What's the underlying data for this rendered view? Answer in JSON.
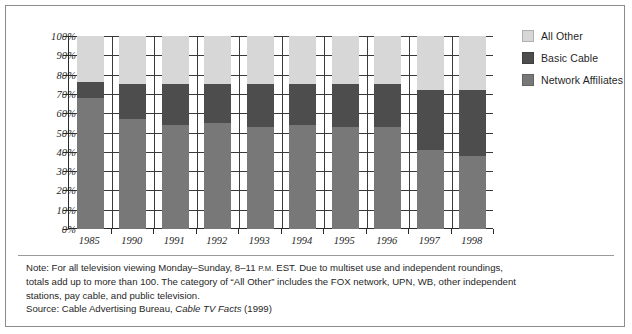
{
  "chart_data": {
    "type": "bar",
    "subtype": "stacked-column",
    "title": "",
    "xlabel": "",
    "ylabel": "",
    "ylim": [
      0,
      100
    ],
    "ytick_labels": [
      "100%",
      "90%",
      "80%",
      "70%",
      "60%",
      "50%",
      "40%",
      "30%",
      "20%",
      "10%",
      "0%"
    ],
    "ytick_values": [
      100,
      90,
      80,
      70,
      60,
      50,
      40,
      30,
      20,
      10,
      0
    ],
    "grid": true,
    "legend_position": "right",
    "categories": [
      "1985",
      "1990",
      "1991",
      "1992",
      "1993",
      "1994",
      "1995",
      "1996",
      "1997",
      "1998"
    ],
    "series": [
      {
        "name": "Network Affiliates",
        "color": "#787878",
        "values": [
          68,
          57,
          54,
          55,
          53,
          54,
          53,
          53,
          41,
          38
        ]
      },
      {
        "name": "Basic Cable",
        "color": "#4d4d4d",
        "values": [
          8,
          18,
          21,
          20,
          22,
          21,
          22,
          22,
          31,
          34
        ]
      },
      {
        "name": "All Other",
        "color": "#d7d7d7",
        "values": [
          24,
          25,
          25,
          25,
          25,
          25,
          25,
          25,
          28,
          28
        ]
      }
    ],
    "stack_tops": {
      "network_affiliates": [
        68,
        57,
        54,
        55,
        53,
        54,
        53,
        53,
        41,
        38
      ],
      "basic_cable_top": [
        76,
        75,
        75,
        75,
        75,
        75,
        75,
        75,
        72,
        72
      ]
    }
  },
  "legend": {
    "items": [
      {
        "label": "All Other",
        "color": "#d7d7d7"
      },
      {
        "label": "Basic Cable",
        "color": "#4d4d4d"
      },
      {
        "label": "Network Affiliates",
        "color": "#787878"
      }
    ]
  },
  "notes": {
    "line1_a": "Note: For all television viewing Monday–Sunday, 8–11 ",
    "line1_smallcaps": "P.M.",
    "line1_b": " EST. Due to multiset use and independent roundings,",
    "line2": "totals add up to more than 100. The category of “All Other” includes the FOX network, UPN, WB, other independent",
    "line3": "stations, pay cable, and public television.",
    "source_prefix": "Source: Cable Advertising Bureau, ",
    "source_italic": "Cable TV Facts",
    "source_suffix": " (1999)"
  }
}
